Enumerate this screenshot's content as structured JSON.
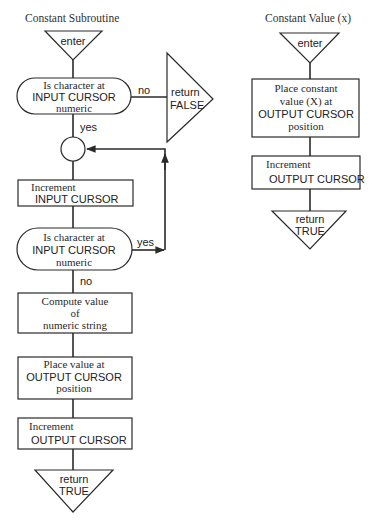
{
  "colors": {
    "ink": "#2a2a2a",
    "background": "#ffffff"
  },
  "left_flow": {
    "title": "Constant Subroutine",
    "enter": "enter",
    "decision1": {
      "line1": "Is character at",
      "line2": "INPUT CURSOR",
      "line3": "numeric",
      "no_label": "no",
      "yes_label": "yes"
    },
    "return_false": {
      "line1": "return",
      "line2": "FALSE"
    },
    "increment_input": {
      "line1": "Increment",
      "line2": "INPUT CURSOR"
    },
    "decision2": {
      "line1": "Is character at",
      "line2": "INPUT CURSOR",
      "line3": "numeric",
      "yes_label": "yes",
      "no_label": "no"
    },
    "compute": {
      "line1": "Compute value",
      "line2": "of",
      "line3": "numeric string"
    },
    "place_value": {
      "line1": "Place value at",
      "line2": "OUTPUT CURSOR",
      "line3": "position"
    },
    "increment_output": {
      "line1": "Increment",
      "line2": "OUTPUT CURSOR"
    },
    "return_true": {
      "line1": "return",
      "line2": "TRUE"
    }
  },
  "right_flow": {
    "title": "Constant Value (x)",
    "enter": "enter",
    "place_constant": {
      "line1": "Place constant",
      "line2": "value (X) at",
      "line3": "OUTPUT CURSOR",
      "line4": "position"
    },
    "increment_output": {
      "line1": "Increment",
      "line2": "OUTPUT CURSOR"
    },
    "return_true": {
      "line1": "return",
      "line2": "TRUE"
    }
  }
}
